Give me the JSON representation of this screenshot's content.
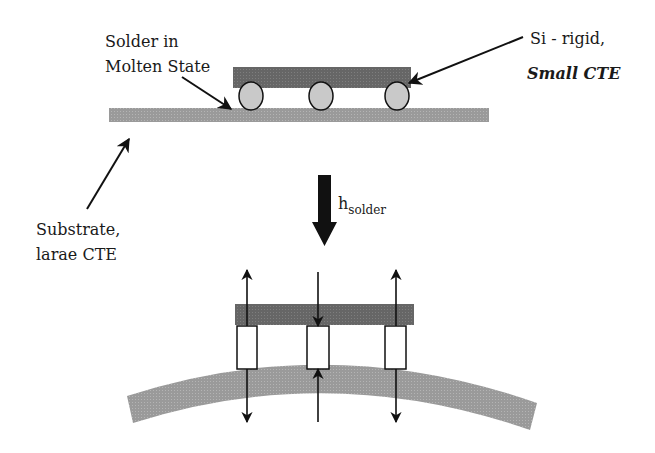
{
  "colors": {
    "die": "#6b6b6b",
    "substrate": "#9e9e9e",
    "solder_ball": "#c8c8c8",
    "joint_box": "#ffffff",
    "stroke": "#111111",
    "text": "#1a1a1a"
  },
  "top_panel": {
    "solder_label": {
      "line1": "Solder in",
      "line2": "Molten State"
    },
    "si_label": {
      "line1": "Si - rigid,",
      "line2": "Small CTE"
    },
    "substrate_label": {
      "line1": "Substrate,",
      "line2": "larae CTE"
    },
    "solder_ball_count": 3
  },
  "transition_arrow": {
    "label_main": "h",
    "label_sub": "solder",
    "icon": "down-arrow-icon"
  },
  "bottom_panel": {
    "joint_count": 3,
    "joints": [
      {
        "position": "left",
        "force": "tension"
      },
      {
        "position": "center",
        "force": "compression"
      },
      {
        "position": "right",
        "force": "tension"
      }
    ]
  }
}
